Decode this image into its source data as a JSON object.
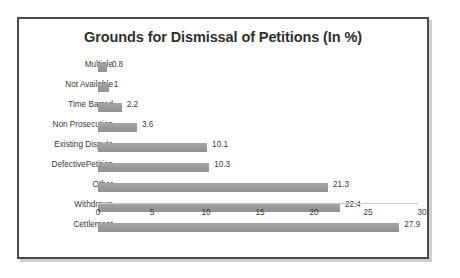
{
  "chart_data": {
    "type": "bar",
    "orientation": "horizontal",
    "title": "Grounds for Dismissal of Petitions (In %)",
    "xlabel": "",
    "ylabel": "",
    "xlim": [
      0,
      30
    ],
    "xticks": [
      0,
      5,
      10,
      15,
      20,
      25,
      30
    ],
    "grid": false,
    "legend": false,
    "bar_color": "#9d9d9d",
    "categories": [
      "Multiple",
      "Not Available",
      "Time Barred",
      "Non Prosecution",
      "Existing Dispute",
      "DefectivePetition",
      "Other",
      "Withdrawn",
      "Cettlement"
    ],
    "values": [
      0.8,
      1,
      2.2,
      3.6,
      10.1,
      10.3,
      21.3,
      22.4,
      27.9
    ],
    "value_labels": [
      "0.8",
      "1",
      "2.2",
      "3.6",
      "10.1",
      "10.3",
      "21.3",
      "22.4",
      "27.9"
    ]
  }
}
